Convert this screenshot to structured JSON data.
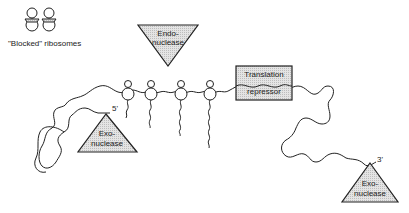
{
  "diagram": {
    "type": "mRNA degradation schematic",
    "legend": {
      "blocked_ribosomes_label": "\"Blocked\" ribosomes"
    },
    "endonuclease": {
      "line1": "Endo-",
      "line2": "nuclease"
    },
    "repressor": {
      "line1": "Translation",
      "line2": "repressor"
    },
    "exonuclease_5": {
      "line1": "Exo-",
      "line2": "nuclease",
      "end_label": "5'"
    },
    "exonuclease_3": {
      "line1": "Exo-",
      "line2": "nuclease",
      "end_label": "3'"
    },
    "ribosome_count": 4
  },
  "colors": {
    "line": "#222222",
    "fill": "#d9d9d9"
  }
}
